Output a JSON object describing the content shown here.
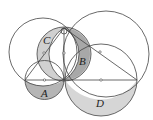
{
  "diagram": {
    "labels": {
      "A": "A",
      "B": "B",
      "C": "C",
      "D": "D"
    },
    "colors": {
      "stroke": "#444444",
      "shade_light": "#d4d4d4",
      "shade_dark": "#a9a9a9",
      "background": "#ffffff"
    }
  }
}
